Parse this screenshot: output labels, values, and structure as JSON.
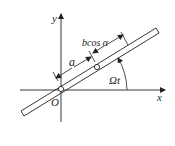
{
  "diagram": {
    "type": "rotating-rod-kinematics",
    "labels": {
      "y_axis": "y",
      "x_axis": "x",
      "origin": "O",
      "length_a": "a",
      "length_bcos": "bcos α",
      "angle": "Ωt"
    },
    "colors": {
      "stroke": "#222222",
      "background": "#ffffff"
    }
  }
}
